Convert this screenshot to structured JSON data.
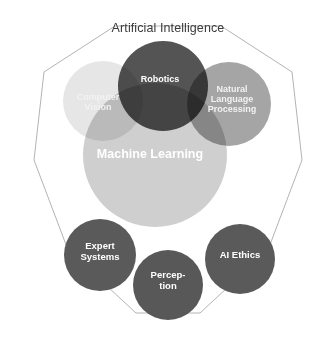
{
  "diagram": {
    "title": "Artificial Intelligence",
    "container_shape": "decagon",
    "colors": {
      "background": "#ffffff",
      "outline": "#b4b4b4",
      "title_text": "#3b3b3b",
      "label_text": "#ffffff",
      "computer_vision": "#e6e6e6",
      "robotics": "#545454",
      "natural_language_processing": "#a5a5a5",
      "machine_learning": "#cfcfcf",
      "expert_systems": "#5a5a5a",
      "perception": "#585858",
      "ai_ethics": "#5a5a5a"
    },
    "overlapping_circles": [
      {
        "id": "computer-vision",
        "label": "Computer Vision",
        "line1": "Computer",
        "line2": "Vision",
        "color": "#e6e6e6"
      },
      {
        "id": "robotics",
        "label": "Robotics",
        "line1": "Robotics",
        "line2": "",
        "color": "#545454"
      },
      {
        "id": "natural-language-processing",
        "label": "Natural Language Processing",
        "line1": "Natural",
        "line2": "Language",
        "line3": "Processing",
        "color": "#a5a5a5"
      },
      {
        "id": "machine-learning",
        "label": "Machine Learning",
        "line1": "Machine Learning",
        "color": "#cfcfcf"
      }
    ],
    "separate_circles": [
      {
        "id": "expert-systems",
        "label": "Expert Systems",
        "line1": "Expert",
        "line2": "Systems",
        "color": "#5a5a5a"
      },
      {
        "id": "perception",
        "label": "Perception",
        "line1": "Percep-",
        "line2": "tion",
        "color": "#585858"
      },
      {
        "id": "ai-ethics",
        "label": "AI Ethics",
        "line1": "AI Ethics",
        "line2": "",
        "color": "#5a5a5a"
      }
    ]
  }
}
